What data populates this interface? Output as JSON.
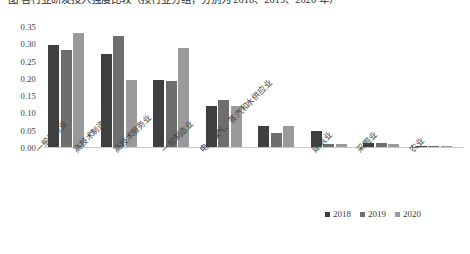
{
  "caption": {
    "text": "图 各行业研发投入强度比较（按行业分组，分别为 2018、2019、2020 年）"
  },
  "chart_data": {
    "type": "bar",
    "title": "",
    "xlabel": "",
    "ylabel": "",
    "ylim": [
      0.0,
      0.35
    ],
    "grid": false,
    "legend_position": "bottom-right",
    "categories": [
      "一般服务业",
      "高技术制造业",
      "高技术服务业",
      "一般制造业",
      "电、煤气、蒸汽和水供应业",
      "建筑业",
      "采掘业",
      "农业"
    ],
    "ytick_labels": [
      "0.35",
      "0.30",
      "0.25",
      "0.20",
      "0.15",
      "0.10",
      "0.05",
      "0.00"
    ],
    "ytick_values": [
      0.35,
      0.3,
      0.25,
      0.2,
      0.15,
      0.1,
      0.05,
      0.0
    ],
    "series": [
      {
        "name": "2018",
        "color": "#3f3f3f",
        "values": [
          0.295,
          0.27,
          0.195,
          0.12,
          0.06,
          0.045,
          0.013,
          0.004
        ]
      },
      {
        "name": "2019",
        "color": "#6e6e6e",
        "values": [
          0.28,
          0.32,
          0.19,
          0.135,
          0.04,
          0.01,
          0.012,
          0.003
        ]
      },
      {
        "name": "2020",
        "color": "#9a9a9a",
        "values": [
          0.33,
          0.195,
          0.285,
          0.118,
          0.06,
          0.008,
          0.01,
          0.003
        ]
      }
    ]
  }
}
